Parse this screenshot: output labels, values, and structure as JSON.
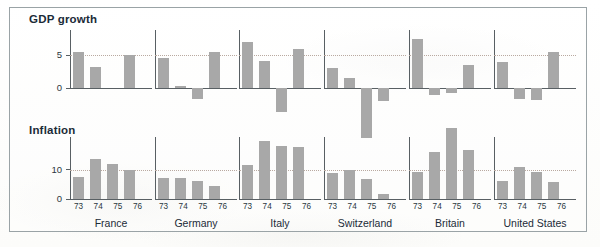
{
  "figure": {
    "sections": [
      {
        "id": "gdp",
        "label": "GDP growth"
      },
      {
        "id": "inflation",
        "label": "Inflation"
      }
    ],
    "countries": [
      "France",
      "Germany",
      "Italy",
      "Switzerland",
      "Britain",
      "United States"
    ],
    "year_labels": [
      "73",
      "74",
      "75",
      "76"
    ],
    "colors": {
      "bar": "#a8a8a8",
      "axis": "#585f63",
      "gridline": "#b9a9a0",
      "frame": "#9aa3a6",
      "text": "#1b2b38",
      "background": "#fdfdfb"
    },
    "gdp_yticks": [
      "0",
      "5"
    ],
    "inflation_yticks": [
      "0",
      "10"
    ]
  },
  "chart_data": [
    {
      "type": "bar",
      "title": "GDP growth",
      "xlabel": "",
      "ylabel": "",
      "categories": [
        "73",
        "74",
        "75",
        "76"
      ],
      "ylim": [
        -8.5,
        8.0
      ],
      "yticks": [
        0,
        5
      ],
      "grid": "dotted horizontal gridline at y = 5",
      "legend": "none",
      "panels": [
        {
          "name": "France",
          "values": [
            5.4,
            3.2,
            0.0,
            5.0
          ]
        },
        {
          "name": "Germany",
          "values": [
            4.6,
            0.3,
            -1.6,
            5.4
          ]
        },
        {
          "name": "Italy",
          "values": [
            7.0,
            4.1,
            -3.6,
            5.9
          ]
        },
        {
          "name": "Switzerland",
          "values": [
            3.0,
            1.5,
            -7.5,
            -2.0
          ]
        },
        {
          "name": "Britain",
          "values": [
            7.4,
            -1.0,
            -0.7,
            3.5
          ]
        },
        {
          "name": "United States",
          "values": [
            4.0,
            -1.6,
            -1.8,
            5.4
          ]
        }
      ]
    },
    {
      "type": "bar",
      "title": "Inflation",
      "xlabel": "",
      "ylabel": "",
      "categories": [
        "73",
        "74",
        "75",
        "76"
      ],
      "ylim": [
        0,
        25.5
      ],
      "yticks": [
        0,
        10
      ],
      "grid": "dotted horizontal gridline at y = 10",
      "legend": "none",
      "panels": [
        {
          "name": "France",
          "values": [
            7.3,
            13.7,
            11.8,
            9.9
          ]
        },
        {
          "name": "Germany",
          "values": [
            7.0,
            7.0,
            6.0,
            4.3
          ]
        },
        {
          "name": "Italy",
          "values": [
            11.4,
            19.5,
            17.8,
            17.5
          ]
        },
        {
          "name": "Switzerland",
          "values": [
            8.7,
            9.8,
            6.7,
            1.7
          ]
        },
        {
          "name": "Britain",
          "values": [
            9.2,
            16.0,
            24.2,
            16.5
          ]
        },
        {
          "name": "United States",
          "values": [
            6.2,
            11.0,
            9.1,
            5.8
          ]
        }
      ]
    }
  ]
}
